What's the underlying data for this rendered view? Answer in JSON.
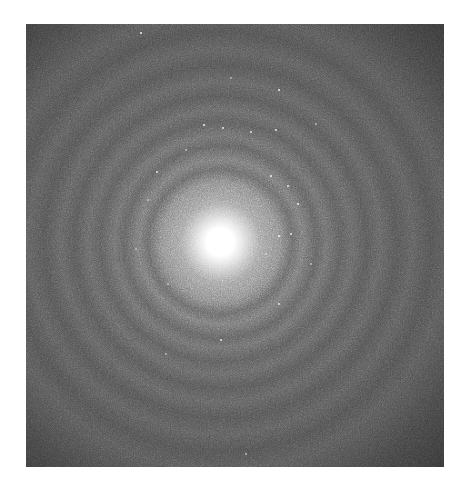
{
  "image": {
    "subject": "electron diffraction pattern",
    "description": "Grayscale diffraction pattern with bright central beam and concentric rings with scattered diffraction spots",
    "center": {
      "x": 219,
      "y": 242
    },
    "colors": {
      "background": "#ffffff",
      "base_gray": "#4a4a4a",
      "central_spot": "#ffffff"
    }
  }
}
